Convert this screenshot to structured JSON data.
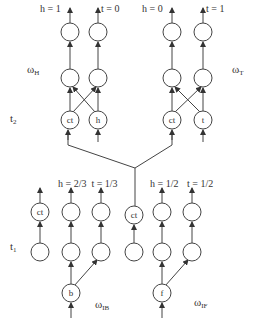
{
  "diagram": {
    "layers": {
      "t2": "t",
      "t2_sub": "2",
      "t1": "t",
      "t1_sub": "1"
    },
    "weights": {
      "H": {
        "base": "ω",
        "sub": "H"
      },
      "T": {
        "base": "ω",
        "sub": "T"
      },
      "IB": {
        "base": "ω",
        "sub": "IB"
      },
      "IF": {
        "base": "ω",
        "sub": "IF"
      }
    },
    "outputs": {
      "top_left_h": "h = 1",
      "top_left_t": "t = 0",
      "top_right_h": "h = 0",
      "top_right_t": "t = 1",
      "bottom_left": "h = 2/3  t = 1/3",
      "bottom_right_h": "h = 1/2",
      "bottom_right_t": "t = 1/2"
    },
    "nodes": {
      "ct": "ct",
      "h": "h",
      "t": "t",
      "b": "b",
      "f": "f"
    }
  }
}
